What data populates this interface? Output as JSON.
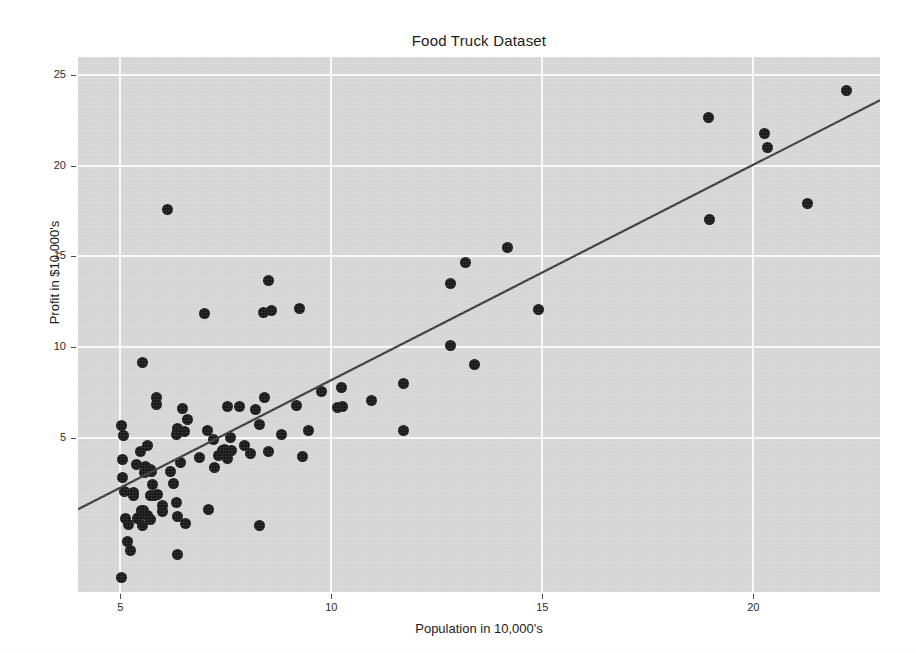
{
  "chart_data": {
    "type": "scatter",
    "title": "Food Truck Dataset",
    "xlabel": "Population in 10,000's",
    "ylabel": "Profit in $10,000's",
    "xlim": [
      4.0,
      23.0
    ],
    "ylim": [
      -3.5,
      26.0
    ],
    "xticks": [
      5,
      10,
      15,
      20
    ],
    "yticks": [
      5,
      10,
      15,
      20,
      25
    ],
    "xticklabels": [
      "5",
      "10",
      "15",
      "20"
    ],
    "yticklabels": [
      "5",
      "10",
      "15",
      "20",
      "25"
    ],
    "grid": true,
    "legend": "none",
    "panel_color": "#d9d9d9",
    "grid_color": "#ffffff",
    "point_color": "#161616",
    "line_color": "#3b3b3b",
    "series": [
      {
        "name": "Food truck profit vs population",
        "marker": "filled-circle",
        "points": [
          [
            6.1101,
            17.592
          ],
          [
            5.5277,
            9.1302
          ],
          [
            8.5186,
            13.662
          ],
          [
            7.0032,
            11.854
          ],
          [
            5.8598,
            6.8233
          ],
          [
            8.3829,
            11.886
          ],
          [
            7.4764,
            4.3483
          ],
          [
            8.5781,
            12.0
          ],
          [
            6.4862,
            6.5987
          ],
          [
            5.0546,
            3.8166
          ],
          [
            5.7107,
            3.2522
          ],
          [
            14.164,
            15.505
          ],
          [
            5.734,
            3.1551
          ],
          [
            8.4084,
            7.2258
          ],
          [
            5.6407,
            0.71618
          ],
          [
            5.3794,
            3.5129
          ],
          [
            6.3654,
            5.3048
          ],
          [
            5.1301,
            0.56077
          ],
          [
            6.4296,
            3.6518
          ],
          [
            7.0708,
            5.3893
          ],
          [
            6.1891,
            3.1386
          ],
          [
            20.27,
            21.767
          ],
          [
            5.4901,
            4.263
          ],
          [
            6.3261,
            5.1875
          ],
          [
            5.5649,
            3.0825
          ],
          [
            18.945,
            22.638
          ],
          [
            12.828,
            13.501
          ],
          [
            10.957,
            7.0467
          ],
          [
            13.176,
            14.692
          ],
          [
            22.203,
            24.147
          ],
          [
            5.2524,
            -1.22
          ],
          [
            6.5894,
            5.9966
          ],
          [
            9.2482,
            12.134
          ],
          [
            5.8918,
            1.8495
          ],
          [
            8.2111,
            6.5426
          ],
          [
            7.9334,
            4.5623
          ],
          [
            8.0959,
            4.1164
          ],
          [
            5.6063,
            3.3928
          ],
          [
            12.836,
            10.117
          ],
          [
            6.3534,
            5.4974
          ],
          [
            5.4069,
            0.55657
          ],
          [
            6.8825,
            3.9115
          ],
          [
            11.708,
            5.3854
          ],
          [
            5.7737,
            2.4406
          ],
          [
            7.8247,
            6.7318
          ],
          [
            7.0931,
            1.0463
          ],
          [
            5.0702,
            5.1337
          ],
          [
            5.8014,
            1.844
          ],
          [
            11.7,
            8.0043
          ],
          [
            5.5416,
            1.0179
          ],
          [
            7.5402,
            6.7504
          ],
          [
            5.3077,
            1.8396
          ],
          [
            7.4239,
            4.2885
          ],
          [
            7.6031,
            4.9981
          ],
          [
            6.3328,
            1.4233
          ],
          [
            6.3589,
            -1.4211
          ],
          [
            6.2742,
            2.4756
          ],
          [
            5.6397,
            4.6042
          ],
          [
            9.3102,
            3.9624
          ],
          [
            9.4536,
            5.4141
          ],
          [
            8.8254,
            5.1694
          ],
          [
            5.1793,
            -0.74279
          ],
          [
            21.279,
            17.929
          ],
          [
            14.908,
            12.054
          ],
          [
            18.959,
            17.054
          ],
          [
            7.2182,
            4.8852
          ],
          [
            8.2951,
            5.7442
          ],
          [
            10.236,
            7.7754
          ],
          [
            5.4994,
            1.0173
          ],
          [
            20.341,
            20.992
          ],
          [
            10.136,
            6.6799
          ],
          [
            7.3345,
            4.0259
          ],
          [
            6.0062,
            1.2784
          ],
          [
            7.2259,
            3.3411
          ],
          [
            5.0269,
            -2.6807
          ],
          [
            6.5479,
            0.29678
          ],
          [
            7.5386,
            3.8845
          ],
          [
            5.0365,
            5.7014
          ],
          [
            10.274,
            6.7526
          ],
          [
            5.1077,
            2.0576
          ],
          [
            5.7292,
            0.47953
          ],
          [
            5.1884,
            0.20421
          ],
          [
            6.3557,
            0.67861
          ],
          [
            9.7687,
            7.5435
          ],
          [
            6.5159,
            5.3436
          ],
          [
            8.5172,
            4.2415
          ],
          [
            9.1802,
            6.7981
          ],
          [
            6.002,
            0.92695
          ],
          [
            5.5204,
            0.152
          ],
          [
            5.0594,
            2.8214
          ],
          [
            5.7077,
            1.8451
          ],
          [
            7.6366,
            4.2959
          ],
          [
            5.8707,
            7.2029
          ],
          [
            5.3054,
            1.9869
          ],
          [
            8.2934,
            0.14454
          ],
          [
            13.394,
            9.0551
          ],
          [
            5.4369,
            0.61705
          ]
        ]
      }
    ],
    "fit_line": {
      "name": "linear regression fit",
      "x0": 4.0,
      "y0": 1.06,
      "x1": 23.0,
      "y1": 23.62
    }
  }
}
